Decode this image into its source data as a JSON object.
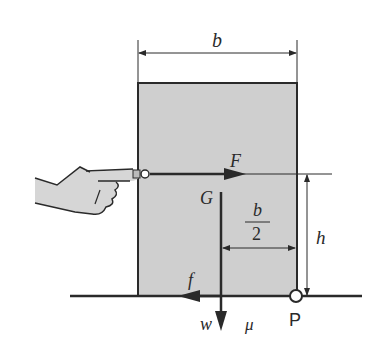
{
  "diagram": {
    "colors": {
      "block_fill": "#cfcfcf",
      "line": "#2a2a2a",
      "hand_fill": "#d6d6d6",
      "background": "#ffffff"
    },
    "labels": {
      "width": "b",
      "push_force": "F",
      "center_of_gravity": "G",
      "half_width_numerator": "b",
      "half_width_denominator": "2",
      "height": "h",
      "friction": "f",
      "weight": "w",
      "friction_coefficient": "μ",
      "pivot_point": "P"
    }
  }
}
